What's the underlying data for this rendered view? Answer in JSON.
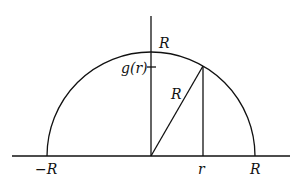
{
  "diagram": {
    "labels": {
      "top_R": "R",
      "g_r": "g(r)",
      "radius_R": "R",
      "neg_R": "−R",
      "r": "r",
      "pos_R": "R"
    },
    "geometry": {
      "center": [
        151,
        156
      ],
      "radius": 104,
      "point_on_circle": [
        203,
        66
      ]
    }
  }
}
